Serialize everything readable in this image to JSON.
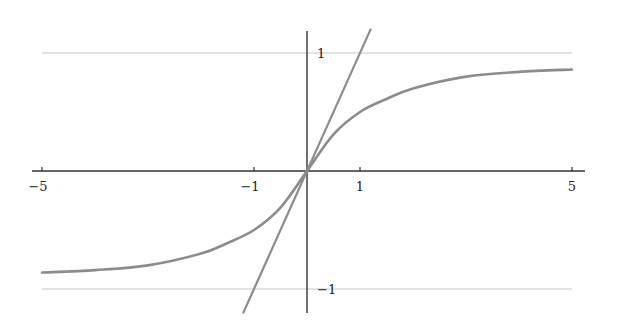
{
  "chart_data": {
    "type": "line",
    "title": "",
    "xlabel": "",
    "ylabel": "",
    "xlim": [
      -5,
      5
    ],
    "ylim": [
      -1.2,
      1.2
    ],
    "grid": false,
    "legend": null,
    "x_ticks": [
      -5,
      -1,
      1,
      5
    ],
    "x_tick_labels": [
      "−5",
      "−1",
      "1",
      "5"
    ],
    "y_ticks": [
      1,
      -1
    ],
    "y_tick_labels": [
      "1",
      "−1"
    ],
    "series": [
      {
        "name": "sigmoid curve",
        "x": [
          -5,
          -4,
          -3,
          -2,
          -1.5,
          -1,
          -0.5,
          0,
          0.5,
          1,
          1.5,
          2,
          3,
          4,
          5
        ],
        "y": [
          -0.86,
          -0.84,
          -0.8,
          -0.7,
          -0.61,
          -0.5,
          -0.31,
          0,
          0.31,
          0.5,
          0.61,
          0.7,
          0.8,
          0.84,
          0.86
        ],
        "color": "#8c8c8c"
      },
      {
        "name": "tangent line y = x",
        "x": [
          -1.2,
          1.2
        ],
        "y": [
          -1.2,
          1.2
        ],
        "color": "#8c8c8c"
      },
      {
        "name": "asymptote y = 1",
        "x": [
          -5,
          5
        ],
        "y": [
          1,
          1
        ],
        "color": "#c8c8c8"
      },
      {
        "name": "asymptote y = -1",
        "x": [
          -5,
          5
        ],
        "y": [
          -1,
          -1
        ],
        "color": "#c8c8c8"
      }
    ]
  }
}
